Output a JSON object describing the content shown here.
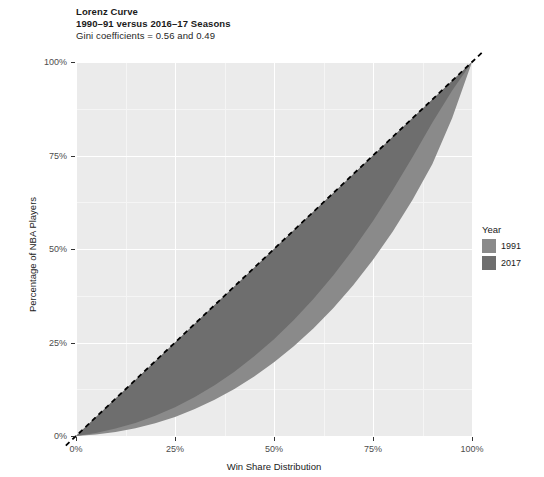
{
  "title": {
    "line1": "Lorenz Curve",
    "line2": "1990–91 versus 2016–17 Seasons",
    "line3": "Gini coefficients = 0.56 and 0.49"
  },
  "axes": {
    "x_title": "Win Share Distribution",
    "y_title": "Percentage of NBA Players",
    "x_ticks": [
      "0%",
      "25%",
      "50%",
      "75%",
      "100%"
    ],
    "y_ticks": [
      "0%",
      "25%",
      "50%",
      "75%",
      "100%"
    ]
  },
  "legend": {
    "title": "Year",
    "items": [
      {
        "label": "1991",
        "color": "#8a8a8a"
      },
      {
        "label": "2017",
        "color": "#6e6e6e"
      }
    ]
  },
  "chart_data": {
    "type": "line",
    "title": "Lorenz Curve",
    "subtitle": "1990–91 versus 2016–17 Seasons",
    "annotation": "Gini coefficients = 0.56 and 0.49",
    "xlabel": "Win Share Distribution",
    "ylabel": "Percentage of NBA Players",
    "xlim": [
      0,
      100
    ],
    "ylim": [
      0,
      100
    ],
    "grid": true,
    "legend_position": "right",
    "legend_title": "Year",
    "reference_line": {
      "name": "Line of equality",
      "style": "dashed",
      "color": "#000000",
      "x": [
        0,
        100
      ],
      "y": [
        0,
        100
      ]
    },
    "fill_between": "curve and line of equality",
    "series": [
      {
        "name": "1991",
        "gini": 0.56,
        "color": "#8a8a8a",
        "x": [
          0,
          5,
          10,
          15,
          20,
          25,
          30,
          35,
          40,
          45,
          50,
          55,
          60,
          65,
          70,
          75,
          80,
          85,
          90,
          95,
          100
        ],
        "y": [
          0,
          0.4,
          1.1,
          2.1,
          3.4,
          5.1,
          7.2,
          9.7,
          12.6,
          15.9,
          19.7,
          24.0,
          28.8,
          34.2,
          40.3,
          47.1,
          54.7,
          63.2,
          72.7,
          85.0,
          100
        ]
      },
      {
        "name": "2017",
        "gini": 0.49,
        "color": "#6e6e6e",
        "x": [
          0,
          5,
          10,
          15,
          20,
          25,
          30,
          35,
          40,
          45,
          50,
          55,
          60,
          65,
          70,
          75,
          80,
          85,
          90,
          95,
          100
        ],
        "y": [
          0,
          0.8,
          2.0,
          3.5,
          5.4,
          7.7,
          10.4,
          13.6,
          17.2,
          21.3,
          25.9,
          31.0,
          36.7,
          43.0,
          49.9,
          57.5,
          65.8,
          74.6,
          83.8,
          92.4,
          100
        ]
      }
    ]
  }
}
